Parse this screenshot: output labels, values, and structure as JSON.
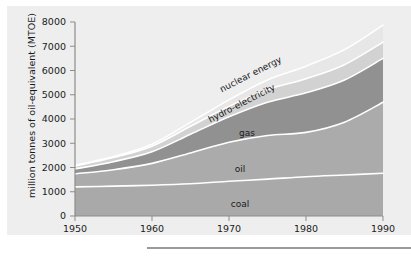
{
  "chart_data": {
    "type": "area",
    "stacked": true,
    "title": "",
    "xlabel": "",
    "ylabel": "million tonnes of oil-equivalent (MTOE)",
    "xlim": [
      1950,
      1990
    ],
    "ylim": [
      0,
      8000
    ],
    "xticks": [
      "1950",
      "1960",
      "1970",
      "1980",
      "1990"
    ],
    "yticks": [
      "0",
      "1000",
      "2000",
      "3000",
      "4000",
      "5000",
      "6000",
      "7000",
      "8000"
    ],
    "grid": false,
    "legend_position": "inline-annotations",
    "x": [
      1950,
      1955,
      1960,
      1965,
      1970,
      1975,
      1980,
      1985,
      1990
    ],
    "series": [
      {
        "name": "coal",
        "label": "coal",
        "color": "#a9a9a9",
        "values": [
          1200,
          1230,
          1270,
          1330,
          1430,
          1520,
          1620,
          1690,
          1760
        ]
      },
      {
        "name": "oil",
        "label": "oil",
        "color": "#ababab",
        "values": [
          540,
          680,
          900,
          1270,
          1610,
          1800,
          1830,
          2180,
          2930
        ]
      },
      {
        "name": "gas",
        "label": "gas",
        "color": "#919191",
        "values": [
          200,
          330,
          480,
          770,
          1050,
          1370,
          1630,
          1740,
          1810
        ]
      },
      {
        "name": "hydro-electricity",
        "label": "hydro-electricity",
        "color": "#d2d2d2",
        "values": [
          120,
          170,
          230,
          330,
          430,
          520,
          580,
          630,
          670
        ]
      },
      {
        "name": "nuclear energy",
        "label": "nuclear energy",
        "color": "#e7e7e7",
        "values": [
          20,
          40,
          80,
          160,
          270,
          400,
          520,
          620,
          700
        ]
      }
    ],
    "totals": [
      2080,
      2450,
      2960,
      3860,
      4790,
      5610,
      6180,
      6860,
      7870
    ]
  },
  "colors": {
    "panel_background": "#eeeeee",
    "page_background": "#ffffff",
    "axis": "#8d8d8d",
    "text": "#1a1a1a",
    "separator_line": "#ffffff",
    "footer_rule": "#9a9a9a"
  },
  "annotations": [
    {
      "text": "nuclear energy",
      "x": 252,
      "y": 77,
      "rotate": -27
    },
    {
      "text": "hydro-electricity",
      "x": 243,
      "y": 106,
      "rotate": -27
    },
    {
      "text": "gas",
      "x": 247,
      "y": 136,
      "rotate": 0
    },
    {
      "text": "oil",
      "x": 240,
      "y": 172,
      "rotate": 0
    },
    {
      "text": "coal",
      "x": 240,
      "y": 207,
      "rotate": 0
    }
  ]
}
